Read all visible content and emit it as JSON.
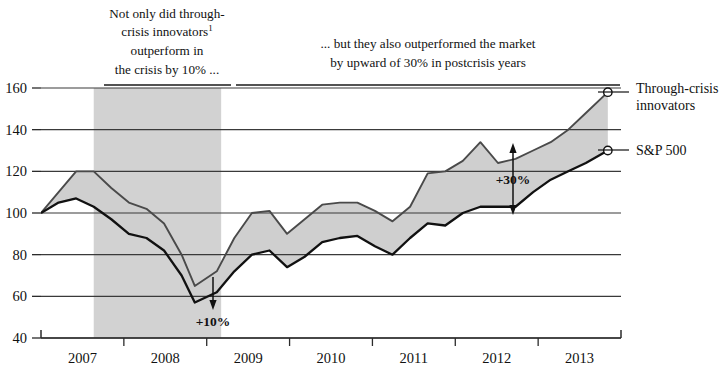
{
  "annotations": {
    "left": {
      "lines": [
        "Not only did through-",
        "crisis innovators",
        "outperform in",
        "the crisis by 10% ..."
      ],
      "footnote_marker": "1"
    },
    "right": {
      "lines": [
        "... but they also outperformed the market",
        "by upward of 30% in postcrisis years"
      ]
    },
    "callout_crisis": "+10%",
    "callout_postcrisis": "+30%"
  },
  "legend": {
    "items": [
      {
        "label_line1": "Through-crisis",
        "label_line2": "innovators",
        "series": "innovators"
      },
      {
        "label_line1": "S&P 500",
        "label_line2": "",
        "series": "sp500"
      }
    ]
  },
  "axis": {
    "y_ticks": [
      "160",
      "140",
      "120",
      "100",
      "80",
      "60",
      "40"
    ],
    "x_ticks": [
      "2007",
      "2008",
      "2009",
      "2010",
      "2011",
      "2012",
      "2013"
    ]
  },
  "colors": {
    "crisis_band": "#d2d2d2",
    "gap_fill": "#cfcfcf",
    "innovators_line": "#4a4a4a",
    "sp500_line": "#111111",
    "grid": "#3a3a3a"
  },
  "chart_data": {
    "type": "line",
    "xlabel": "",
    "ylabel": "",
    "ylim": [
      40,
      160
    ],
    "xlim": [
      2007.0,
      2013.6
    ],
    "grid": true,
    "legend_position": "right-outside",
    "index_base": 100,
    "shaded_region": {
      "label": "crisis",
      "x_start": 2007.6,
      "x_end": 2009.05
    },
    "annotations": [
      {
        "text": "+10%",
        "x": 2008.75,
        "y_low": 57,
        "y_high": 65,
        "type": "gap-arrow"
      },
      {
        "text": "+30%",
        "x": 2012.0,
        "y_low": 103,
        "y_high": 134,
        "type": "gap-arrow"
      }
    ],
    "x": [
      2007.0,
      2007.2,
      2007.4,
      2007.6,
      2007.8,
      2008.0,
      2008.2,
      2008.4,
      2008.6,
      2008.75,
      2009.0,
      2009.2,
      2009.4,
      2009.6,
      2009.8,
      2010.0,
      2010.2,
      2010.4,
      2010.6,
      2010.8,
      2011.0,
      2011.2,
      2011.4,
      2011.6,
      2011.8,
      2012.0,
      2012.2,
      2012.4,
      2012.6,
      2012.8,
      2013.0,
      2013.2,
      2013.45
    ],
    "series": [
      {
        "name": "Through-crisis innovators",
        "values": [
          100,
          110,
          120,
          120,
          112,
          105,
          102,
          95,
          80,
          65,
          72,
          88,
          100,
          101,
          90,
          97,
          104,
          105,
          105,
          101,
          96,
          103,
          119,
          120,
          125,
          134,
          124,
          126,
          130,
          134,
          140,
          148,
          158
        ]
      },
      {
        "name": "S&P 500",
        "values": [
          100,
          105,
          107,
          103,
          97,
          90,
          88,
          82,
          70,
          57,
          62,
          72,
          80,
          82,
          74,
          79,
          86,
          88,
          89,
          84,
          80,
          88,
          95,
          94,
          100,
          103,
          103,
          103,
          110,
          116,
          120,
          124,
          130
        ]
      }
    ]
  }
}
